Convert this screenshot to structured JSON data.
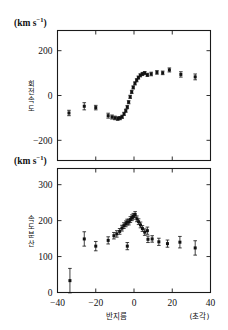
{
  "figure": {
    "width": 228,
    "height": 330,
    "background": "#ffffff",
    "ink_color": "#111111"
  },
  "shared": {
    "xlabel": "반지름",
    "xunit": "(초각)",
    "xlim": [
      -40,
      40
    ],
    "xticks": [
      -40,
      -20,
      0,
      20,
      40
    ],
    "xticklabels": [
      "−40",
      "−20",
      "0",
      "20",
      "40"
    ],
    "unit_text": "(km s",
    "unit_sup": "−1",
    "unit_close": ")"
  },
  "chart_data": [
    {
      "type": "scatter",
      "id": "rotation-velocity-panel",
      "title": "",
      "xlabel": "반지름",
      "ylabel": "회전속도",
      "ylabel_chars": [
        "회",
        "전",
        "속",
        "도"
      ],
      "unit": "(km s−1)",
      "xlim": [
        -40,
        40
      ],
      "ylim": [
        -290,
        290
      ],
      "yticks": [
        -200,
        0,
        200
      ],
      "yticklabels": [
        "−200",
        "0",
        "200"
      ],
      "grid": false,
      "legend": false,
      "errorbars": true,
      "points": [
        {
          "x": -34.0,
          "y": -78,
          "yerr": 12
        },
        {
          "x": -26.0,
          "y": -48,
          "yerr": 16
        },
        {
          "x": -20.0,
          "y": -54,
          "yerr": 10
        },
        {
          "x": -13.5,
          "y": -90,
          "yerr": 11
        },
        {
          "x": -11.5,
          "y": -96,
          "yerr": 9
        },
        {
          "x": -10.0,
          "y": -100,
          "yerr": 8
        },
        {
          "x": -8.5,
          "y": -103,
          "yerr": 8
        },
        {
          "x": -7.3,
          "y": -101,
          "yerr": 7
        },
        {
          "x": -6.2,
          "y": -95,
          "yerr": 7
        },
        {
          "x": -5.2,
          "y": -82,
          "yerr": 7
        },
        {
          "x": -4.3,
          "y": -68,
          "yerr": 7
        },
        {
          "x": -3.5,
          "y": -52,
          "yerr": 7
        },
        {
          "x": -2.8,
          "y": -30,
          "yerr": 7
        },
        {
          "x": -2.0,
          "y": -6,
          "yerr": 7
        },
        {
          "x": -1.2,
          "y": 16,
          "yerr": 7
        },
        {
          "x": -0.4,
          "y": 36,
          "yerr": 7
        },
        {
          "x": 0.5,
          "y": 54,
          "yerr": 7
        },
        {
          "x": 1.4,
          "y": 68,
          "yerr": 7
        },
        {
          "x": 2.3,
          "y": 80,
          "yerr": 7
        },
        {
          "x": 3.3,
          "y": 90,
          "yerr": 7
        },
        {
          "x": 4.4,
          "y": 96,
          "yerr": 7
        },
        {
          "x": 5.6,
          "y": 100,
          "yerr": 7
        },
        {
          "x": 7.0,
          "y": 92,
          "yerr": 7
        },
        {
          "x": 9.0,
          "y": 96,
          "yerr": 8
        },
        {
          "x": 12.0,
          "y": 103,
          "yerr": 8
        },
        {
          "x": 15.0,
          "y": 101,
          "yerr": 8
        },
        {
          "x": 18.5,
          "y": 114,
          "yerr": 9
        },
        {
          "x": 24.5,
          "y": 94,
          "yerr": 12
        },
        {
          "x": 32.0,
          "y": 83,
          "yerr": 13
        }
      ]
    },
    {
      "type": "scatter",
      "id": "velocity-dispersion-panel",
      "title": "",
      "xlabel": "반지름",
      "ylabel": "속도분산",
      "ylabel_chars": [
        "속",
        "도",
        "분",
        "산"
      ],
      "unit": "(km s−1)",
      "xlim": [
        -40,
        40
      ],
      "ylim": [
        0,
        345
      ],
      "yticks": [
        0,
        100,
        200,
        300
      ],
      "yticklabels": [
        "0",
        "100",
        "200",
        "300"
      ],
      "grid": false,
      "legend": false,
      "errorbars": true,
      "points": [
        {
          "x": -33.5,
          "y": 33,
          "yerr": 34
        },
        {
          "x": -26.0,
          "y": 149,
          "yerr": 20
        },
        {
          "x": -20.0,
          "y": 129,
          "yerr": 13
        },
        {
          "x": -13.5,
          "y": 145,
          "yerr": 10
        },
        {
          "x": -10.5,
          "y": 158,
          "yerr": 9
        },
        {
          "x": -9.0,
          "y": 163,
          "yerr": 9
        },
        {
          "x": -7.5,
          "y": 170,
          "yerr": 8
        },
        {
          "x": -6.3,
          "y": 179,
          "yerr": 8
        },
        {
          "x": -5.3,
          "y": 186,
          "yerr": 8
        },
        {
          "x": -4.3,
          "y": 191,
          "yerr": 8
        },
        {
          "x": -3.6,
          "y": 196,
          "yerr": 8
        },
        {
          "x": -3.5,
          "y": 129,
          "yerr": 10
        },
        {
          "x": -2.7,
          "y": 196,
          "yerr": 8
        },
        {
          "x": -1.9,
          "y": 203,
          "yerr": 8
        },
        {
          "x": -1.1,
          "y": 208,
          "yerr": 8
        },
        {
          "x": -0.3,
          "y": 212,
          "yerr": 8
        },
        {
          "x": 0.6,
          "y": 217,
          "yerr": 8
        },
        {
          "x": 1.5,
          "y": 205,
          "yerr": 8
        },
        {
          "x": 2.4,
          "y": 197,
          "yerr": 8
        },
        {
          "x": 3.4,
          "y": 188,
          "yerr": 8
        },
        {
          "x": 4.4,
          "y": 178,
          "yerr": 8
        },
        {
          "x": 5.6,
          "y": 168,
          "yerr": 9
        },
        {
          "x": 7.0,
          "y": 172,
          "yerr": 10
        },
        {
          "x": 7.3,
          "y": 148,
          "yerr": 9
        },
        {
          "x": 9.5,
          "y": 149,
          "yerr": 9
        },
        {
          "x": 13.0,
          "y": 141,
          "yerr": 10
        },
        {
          "x": 17.5,
          "y": 136,
          "yerr": 10
        },
        {
          "x": 24.0,
          "y": 140,
          "yerr": 16
        },
        {
          "x": 32.0,
          "y": 124,
          "yerr": 20
        }
      ]
    }
  ]
}
